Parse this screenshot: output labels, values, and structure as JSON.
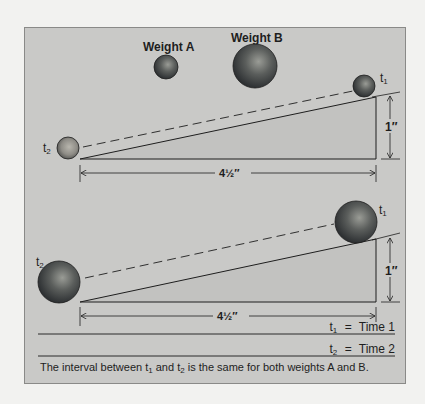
{
  "figure": {
    "labels": {
      "weight_a": "Weight A",
      "weight_b": "Weight B"
    },
    "top_ramp": {
      "weight": "A",
      "ball_start_label": "t",
      "ball_start_sub": "1",
      "ball_end_label": "t",
      "ball_end_sub": "2",
      "height_label": "1″",
      "length_label": "4½″"
    },
    "bottom_ramp": {
      "weight": "B",
      "ball_start_label": "t",
      "ball_start_sub": "1",
      "ball_end_label": "t",
      "ball_end_sub": "2",
      "height_label": "1″",
      "length_label": "4½″"
    },
    "legend": [
      {
        "symbol": "t",
        "sub": "1",
        "equals": "=",
        "meaning": "Time 1"
      },
      {
        "symbol": "t",
        "sub": "2",
        "equals": "=",
        "meaning": "Time 2"
      }
    ],
    "caption": {
      "part1": "The interval between t",
      "sub1": "1",
      "part2": " and t",
      "sub2": "2",
      "part3": " is the same for both weights A and B."
    },
    "colors": {
      "panel_bg": "#c9c9c7",
      "page_bg": "#f2f2f0",
      "ink": "#1e1e1e",
      "ball_dark": "#2e3236",
      "ball_light": "#8a8c86"
    }
  }
}
